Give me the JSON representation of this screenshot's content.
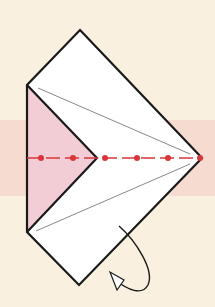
{
  "diagram": {
    "colors": {
      "background": "#f9f0df",
      "band": "#f6dcd0",
      "paper_front": "#ffffff",
      "paper_back": "#f3cdd6",
      "outline": "#1a1a1a",
      "crease": "#7a7a7a",
      "valley_fold": "#d8363b"
    },
    "elements": [
      {
        "name": "paper-square",
        "type": "folded square"
      },
      {
        "name": "pink-flap",
        "type": "triangle back side"
      },
      {
        "name": "valley-fold-line",
        "type": "dash-dot fold line"
      },
      {
        "name": "turn-over-arrow",
        "type": "curved arrow"
      }
    ]
  }
}
